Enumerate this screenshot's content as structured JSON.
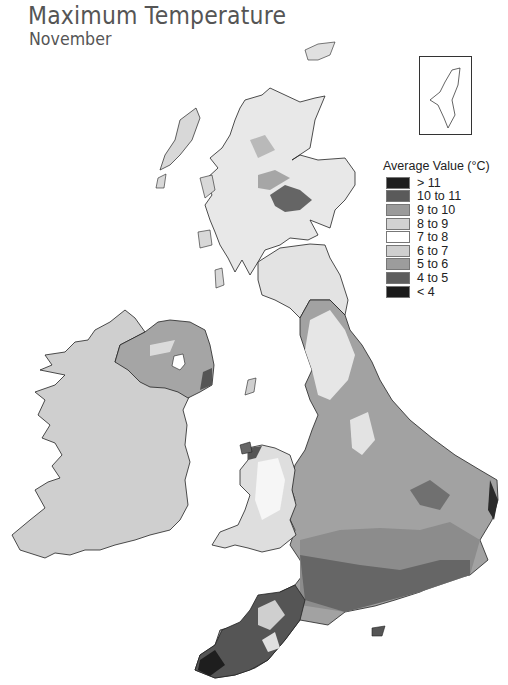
{
  "title": "Maximum Temperature",
  "subtitle": "November",
  "legend": {
    "title": "Average Value (°C)",
    "items": [
      {
        "label": "> 11",
        "color": "#1e1e1e"
      },
      {
        "label": "10 to 11",
        "color": "#5a5a5a"
      },
      {
        "label": "9 to 10",
        "color": "#9a9a9a"
      },
      {
        "label": "8 to 9",
        "color": "#d2d2d2"
      },
      {
        "label": "7 to 8",
        "color": "#ffffff"
      },
      {
        "label": "6 to 7",
        "color": "#cfcfcf"
      },
      {
        "label": "5 to 6",
        "color": "#9c9c9c"
      },
      {
        "label": "4 to 5",
        "color": "#5e5e5e"
      },
      {
        "label": "< 4",
        "color": "#1a1a1a"
      }
    ]
  },
  "inset": {
    "name": "Shetland Islands"
  },
  "regions": {
    "ireland": {
      "fill": "#cfcfcf"
    },
    "northern_ireland": {
      "fill": "#a5a5a5"
    },
    "scotland_highlands": {
      "fill": "#e8e8e8"
    },
    "southern_uplands": {
      "fill": "#e3e3e3"
    },
    "northern_england": {
      "fill": "#e0e0e0"
    },
    "east_england": {
      "fill": "#a2a2a2"
    },
    "wales": {
      "fill": "#dedede"
    },
    "south_england": {
      "fill": "#8c8c8c"
    },
    "southwest": {
      "fill": "#555555"
    }
  }
}
